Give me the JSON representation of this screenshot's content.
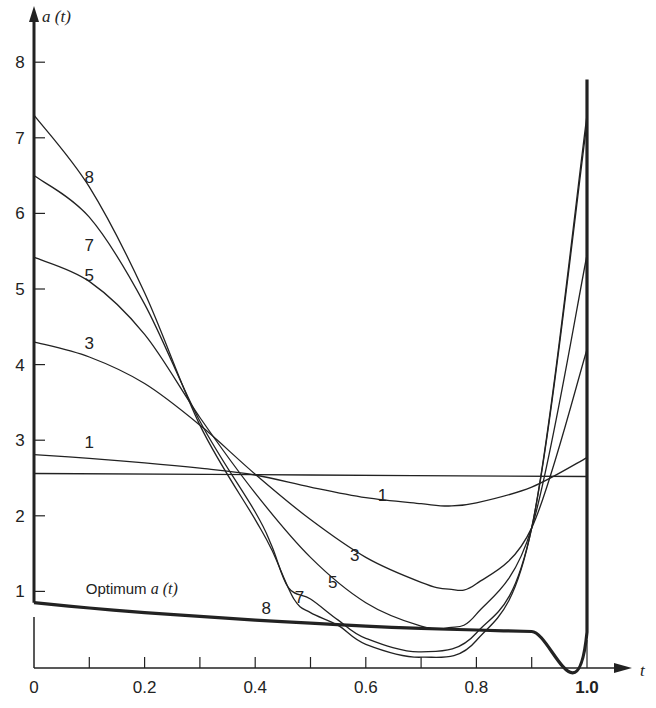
{
  "chart_data": {
    "type": "line",
    "title": "",
    "xlabel": "t",
    "ylabel": "a(t)",
    "xlim": [
      0,
      1.0
    ],
    "ylim": [
      0,
      8
    ],
    "grid": false,
    "legend": "inline curve labels",
    "x_ticks": [
      0,
      0.1,
      0.2,
      0.3,
      0.4,
      0.5,
      0.6,
      0.7,
      0.8,
      0.9,
      1.0
    ],
    "x_tick_labels": [
      "0",
      "",
      "0.2",
      "",
      "0.4",
      "",
      "0.6",
      "",
      "0.8",
      "",
      "1.0"
    ],
    "y_ticks": [
      1,
      2,
      3,
      4,
      5,
      6,
      7,
      8
    ],
    "y_tick_labels": [
      "1",
      "2",
      "3",
      "4",
      "5",
      "6",
      "7",
      "8"
    ],
    "series": [
      {
        "name": "Optimum a(t)",
        "style": "thick",
        "points": [
          [
            0,
            0.85
          ],
          [
            0.1,
            0.78
          ],
          [
            0.2,
            0.72
          ],
          [
            0.3,
            0.67
          ],
          [
            0.4,
            0.62
          ],
          [
            0.5,
            0.58
          ],
          [
            0.6,
            0.54
          ],
          [
            0.7,
            0.51
          ],
          [
            0.8,
            0.49
          ],
          [
            0.9,
            0.47
          ],
          [
            1.0,
            0.46
          ],
          [
            1.0,
            7.77
          ]
        ]
      },
      {
        "name": "0",
        "style": "thin",
        "points": [
          [
            0,
            2.56
          ],
          [
            0.5,
            2.54
          ],
          [
            1.0,
            2.52
          ]
        ]
      },
      {
        "name": "1",
        "style": "thin",
        "points": [
          [
            0,
            2.81
          ],
          [
            0.1,
            2.76
          ],
          [
            0.2,
            2.7
          ],
          [
            0.3,
            2.63
          ],
          [
            0.4,
            2.54
          ],
          [
            0.5,
            2.38
          ],
          [
            0.6,
            2.24
          ],
          [
            0.7,
            2.16
          ],
          [
            0.75,
            2.13
          ],
          [
            0.8,
            2.17
          ],
          [
            0.9,
            2.38
          ],
          [
            1.0,
            2.77
          ]
        ]
      },
      {
        "name": "3",
        "style": "thin",
        "points": [
          [
            0,
            4.3
          ],
          [
            0.1,
            4.1
          ],
          [
            0.2,
            3.75
          ],
          [
            0.3,
            3.2
          ],
          [
            0.4,
            2.55
          ],
          [
            0.5,
            1.95
          ],
          [
            0.6,
            1.45
          ],
          [
            0.7,
            1.12
          ],
          [
            0.75,
            1.03
          ],
          [
            0.8,
            1.1
          ],
          [
            0.9,
            1.84
          ],
          [
            1.0,
            4.2
          ]
        ]
      },
      {
        "name": "5",
        "style": "thin",
        "points": [
          [
            0,
            5.42
          ],
          [
            0.1,
            5.1
          ],
          [
            0.2,
            4.4
          ],
          [
            0.3,
            3.3
          ],
          [
            0.4,
            2.3
          ],
          [
            0.5,
            1.45
          ],
          [
            0.6,
            0.85
          ],
          [
            0.7,
            0.54
          ],
          [
            0.75,
            0.52
          ],
          [
            0.8,
            0.7
          ],
          [
            0.9,
            1.84
          ],
          [
            1.0,
            5.45
          ]
        ]
      },
      {
        "name": "7",
        "style": "thin",
        "points": [
          [
            0,
            6.5
          ],
          [
            0.1,
            5.95
          ],
          [
            0.2,
            4.8
          ],
          [
            0.3,
            3.25
          ],
          [
            0.4,
            2.05
          ],
          [
            0.43,
            1.6
          ],
          [
            0.46,
            1.05
          ],
          [
            0.5,
            0.9
          ],
          [
            0.55,
            0.62
          ],
          [
            0.6,
            0.38
          ],
          [
            0.7,
            0.2
          ],
          [
            0.8,
            0.45
          ],
          [
            0.9,
            1.84
          ],
          [
            1.0,
            7.2
          ]
        ]
      },
      {
        "name": "8",
        "style": "thin",
        "points": [
          [
            0,
            7.3
          ],
          [
            0.1,
            6.35
          ],
          [
            0.2,
            4.95
          ],
          [
            0.3,
            3.2
          ],
          [
            0.4,
            1.95
          ],
          [
            0.43,
            1.55
          ],
          [
            0.47,
            0.9
          ],
          [
            0.5,
            0.72
          ],
          [
            0.55,
            0.55
          ],
          [
            0.6,
            0.3
          ],
          [
            0.7,
            0.13
          ],
          [
            0.8,
            0.35
          ],
          [
            0.9,
            1.84
          ],
          [
            1.0,
            7.3
          ]
        ]
      }
    ],
    "annotations": [
      {
        "text": "8",
        "t": 0.1,
        "a": 6.4
      },
      {
        "text": "7",
        "t": 0.1,
        "a": 5.5
      },
      {
        "text": "5",
        "t": 0.1,
        "a": 5.1
      },
      {
        "text": "3",
        "t": 0.1,
        "a": 4.2
      },
      {
        "text": "1",
        "t": 0.1,
        "a": 2.9
      },
      {
        "text": "1",
        "t": 0.63,
        "a": 2.2
      },
      {
        "text": "3",
        "t": 0.58,
        "a": 1.4
      },
      {
        "text": "5",
        "t": 0.54,
        "a": 1.05
      },
      {
        "text": "7",
        "t": 0.48,
        "a": 0.85
      },
      {
        "text": "8",
        "t": 0.42,
        "a": 0.7
      },
      {
        "text": "Optimum a(t)",
        "t": 0.09,
        "a": 0.97
      }
    ]
  },
  "axes": {
    "y_title": "a (t)",
    "x_title": "t"
  },
  "labels": {
    "optimum": "Optimum",
    "optimum_var": "a (t)"
  }
}
